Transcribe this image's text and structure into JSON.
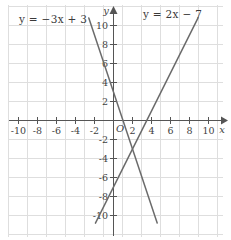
{
  "chart_data": {
    "type": "line",
    "title": "",
    "xlabel": "x",
    "ylabel": "y",
    "xlim": [
      -11.6,
      11.6
    ],
    "ylim": [
      -11.6,
      11.6
    ],
    "grid": true,
    "grid_step": 2,
    "legend_position": "inline-annotations",
    "x_ticks": [
      -10,
      -8,
      -6,
      -4,
      -2,
      2,
      4,
      6,
      8,
      10
    ],
    "y_ticks": [
      10,
      8,
      6,
      4,
      2,
      -2,
      -4,
      -6,
      -8,
      -10
    ],
    "x_tick_labels": [
      "-10",
      "-8",
      "-6",
      "-4",
      "-2",
      "2",
      "4",
      "6",
      "8",
      "10"
    ],
    "y_tick_labels": [
      "10",
      "8",
      "6",
      "4",
      "2",
      "-2",
      "-4",
      "-6",
      "-8",
      "-10"
    ],
    "origin_label": "O",
    "series": [
      {
        "name": "y = -3x + 3",
        "label_text": "y = −3x + 3",
        "slope": -3,
        "intercept": 3,
        "color": "#6b6b6b",
        "x_endpoints": [
          -2.6,
          4.6
        ],
        "y_endpoints": [
          10.8,
          -10.8
        ]
      },
      {
        "name": "y = 2x - 7",
        "label_text": "y = 2x − 7",
        "slope": 2,
        "intercept": -7,
        "color": "#6b6b6b",
        "x_endpoints": [
          -1.9,
          8.9
        ],
        "y_endpoints": [
          -10.8,
          10.8
        ]
      }
    ],
    "intersection": {
      "x": 2,
      "y": -3
    },
    "annotations": [
      {
        "id": "eq-left",
        "text": "y = −3x + 3"
      },
      {
        "id": "eq-right",
        "text": "y = 2x − 7"
      }
    ]
  },
  "axes": {
    "x_axis_name": "x",
    "y_axis_name": "y",
    "origin": "O",
    "axis_color": "#555555",
    "grid_color": "#dedede",
    "line_color": "#6b6b6b"
  },
  "labels": {
    "equation_left": "y = −3x + 3",
    "equation_right": "y = 2x − 7"
  }
}
